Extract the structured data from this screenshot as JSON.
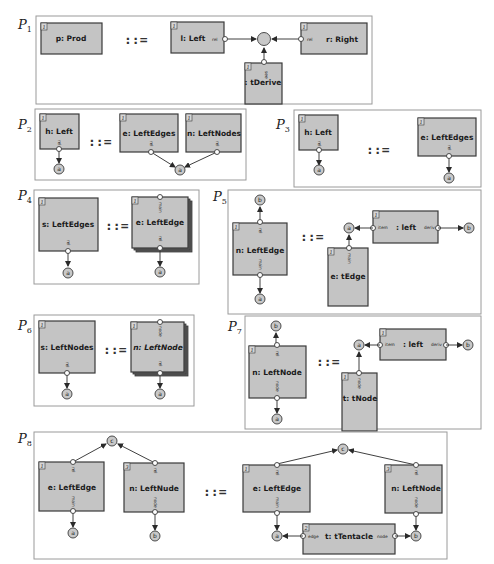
{
  "figure": {
    "definition_symbol": "::=",
    "productions": [
      {
        "id": "P1",
        "label": "P",
        "sub": "1",
        "lhs": [
          {
            "index": "1",
            "name": "p: Prod"
          }
        ],
        "rhs": {
          "boxes": [
            {
              "index": "1",
              "name": "l: Left",
              "tentacles": [
                "rel"
              ]
            },
            {
              "index": "1",
              "name": "r: Right",
              "tentacles": [
                "rel"
              ]
            },
            {
              "index": "1",
              "name": ": tDerive",
              "tentacles": [
                "see"
              ]
            }
          ],
          "nodes": [
            ""
          ]
        }
      },
      {
        "id": "P2",
        "label": "P",
        "sub": "2",
        "lhs": [
          {
            "index": "1",
            "name": "h: Left",
            "tentacles": [
              "rel"
            ]
          }
        ],
        "lhs_nodes": [
          "a"
        ],
        "rhs": {
          "boxes": [
            {
              "index": "1",
              "name": "e: LeftEdges",
              "tentacles": [
                "rel"
              ]
            },
            {
              "index": "1",
              "name": "n: LeftNodes",
              "tentacles": [
                "rel"
              ]
            }
          ],
          "nodes": [
            "a"
          ]
        }
      },
      {
        "id": "P3",
        "label": "P",
        "sub": "3",
        "lhs": [
          {
            "index": "1",
            "name": "h: Left",
            "tentacles": [
              "rel"
            ]
          }
        ],
        "lhs_nodes": [
          "a"
        ],
        "rhs": {
          "boxes": [
            {
              "index": "1",
              "name": "e: LeftEdges",
              "tentacles": [
                "rel"
              ]
            }
          ],
          "nodes": [
            "a"
          ]
        }
      },
      {
        "id": "P4",
        "label": "P",
        "sub": "4",
        "lhs": [
          {
            "index": "1",
            "name": "s: LeftEdges",
            "tentacles": [
              "rel"
            ]
          }
        ],
        "lhs_nodes": [
          "a"
        ],
        "rhs": {
          "boxes": [
            {
              "index": "1",
              "name": "e: LeftEdge",
              "multi": true,
              "tentacles": [
                "main",
                "rel"
              ]
            }
          ],
          "nodes": [
            "a"
          ]
        }
      },
      {
        "id": "P5",
        "label": "P",
        "sub": "5",
        "lhs": [
          {
            "index": "1",
            "name": "n: LeftEdge",
            "tentacles": [
              "rel",
              "main"
            ]
          }
        ],
        "lhs_nodes": [
          "b",
          "a"
        ],
        "rhs": {
          "boxes": [
            {
              "index": "1",
              "name": ": left",
              "tentacles": [
                "item",
                "deriv"
              ]
            },
            {
              "index": "1",
              "name": "e: tEdge",
              "tentacles": [
                "main"
              ]
            }
          ],
          "nodes": [
            "a",
            "b"
          ]
        }
      },
      {
        "id": "P6",
        "label": "P",
        "sub": "6",
        "lhs": [
          {
            "index": "1",
            "name": "s: LeftNodes",
            "tentacles": [
              "rel"
            ]
          }
        ],
        "lhs_nodes": [
          "a"
        ],
        "rhs": {
          "boxes": [
            {
              "index": "1",
              "name": "n: LeftNode",
              "multi": true,
              "tentacles": [
                "node",
                "rel"
              ]
            }
          ],
          "nodes": [
            "a"
          ]
        }
      },
      {
        "id": "P7",
        "label": "P",
        "sub": "7",
        "lhs": [
          {
            "index": "1",
            "name": "n: LeftNode",
            "tentacles": [
              "rel",
              "node"
            ]
          }
        ],
        "lhs_nodes": [
          "b",
          "a"
        ],
        "rhs": {
          "boxes": [
            {
              "index": "1",
              "name": ": left",
              "tentacles": [
                "item",
                "deriv"
              ]
            },
            {
              "index": "1",
              "name": "t: tNode",
              "tentacles": [
                "node"
              ]
            }
          ],
          "nodes": [
            "a",
            "b"
          ]
        }
      },
      {
        "id": "P8",
        "label": "P",
        "sub": "8",
        "lhs": [
          {
            "index": "1",
            "name": "e: LeftEdge",
            "tentacles": [
              "rel",
              "main"
            ]
          },
          {
            "index": "3",
            "name": "n: LeftNude",
            "tentacles": [
              "rel",
              "node"
            ]
          }
        ],
        "lhs_nodes": [
          "c",
          "a",
          "b"
        ],
        "rhs": {
          "boxes": [
            {
              "index": "1",
              "name": "e: LeftEdge",
              "tentacles": [
                "rel",
                "main"
              ]
            },
            {
              "index": "3",
              "name": "n: LeftNode",
              "tentacles": [
                "rel",
                "node"
              ]
            },
            {
              "index": "2",
              "name": "t: tTentacle",
              "tentacles": [
                "edge",
                "node"
              ]
            }
          ],
          "nodes": [
            "c",
            "a",
            "b"
          ]
        }
      }
    ]
  }
}
